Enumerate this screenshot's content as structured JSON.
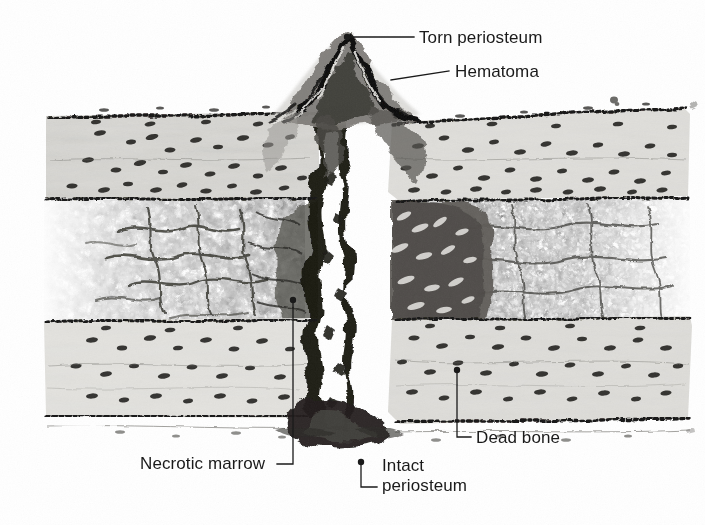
{
  "figure": {
    "background_color": "#ffffff",
    "ink_color": "#1a1a1a",
    "width": 705,
    "height": 525
  },
  "labels": [
    {
      "id": "torn-periosteum",
      "text": "Torn periosteum",
      "x": 419,
      "y": 28,
      "leader": {
        "type": "dot-line",
        "dot": [
          347,
          37
        ],
        "points": [
          [
            347,
            37
          ],
          [
            414,
            37
          ]
        ]
      }
    },
    {
      "id": "hematoma",
      "text": "Hematoma",
      "x": 455,
      "y": 62,
      "leader": {
        "type": "dot-line",
        "dot": [
          392,
          80
        ],
        "points": [
          [
            392,
            80
          ],
          [
            449,
            71
          ]
        ]
      }
    },
    {
      "id": "dead-bone",
      "text": "Dead bone",
      "x": 475,
      "y": 428,
      "leader": {
        "type": "elbow",
        "dot": [
          457,
          370
        ],
        "points": [
          [
            457,
            370
          ],
          [
            457,
            437
          ],
          [
            470,
            437
          ]
        ]
      }
    },
    {
      "id": "necrotic-marrow",
      "text": "Necrotic marrow",
      "x": 140,
      "y": 455,
      "leader": {
        "type": "elbow",
        "dot": [
          293,
          300
        ],
        "points": [
          [
            293,
            300
          ],
          [
            293,
            464
          ],
          [
            277,
            464
          ]
        ]
      }
    },
    {
      "id": "intact-periosteum",
      "text": "Intact\nperiosteum",
      "x": 381,
      "y": 458,
      "leader": {
        "type": "elbow",
        "dot": [
          361,
          462
        ],
        "points": [
          [
            361,
            462
          ],
          [
            361,
            487
          ],
          [
            377,
            487
          ]
        ]
      }
    }
  ],
  "anatomy": {
    "regions": [
      {
        "id": "upper-cortex-left",
        "name": "Upper cortical bone (left fragment)",
        "tone": "#d7d6d2"
      },
      {
        "id": "upper-cortex-right",
        "name": "Upper cortical bone (right fragment)",
        "tone": "#dddcd8"
      },
      {
        "id": "lower-cortex-left",
        "name": "Lower cortical bone (left fragment)",
        "tone": "#e2e1dd"
      },
      {
        "id": "lower-cortex-right",
        "name": "Lower cortical bone (right fragment)",
        "tone": "#dedcd8"
      },
      {
        "id": "marrow-cavity",
        "name": "Trabecular marrow cavity",
        "tone": "#efeeea"
      },
      {
        "id": "necrotic-zone",
        "name": "Necrotic marrow adjacent to fracture",
        "tone": "#6e6c68"
      },
      {
        "id": "fracture-gap",
        "name": "Fracture cleft",
        "tone": "#ffffff"
      },
      {
        "id": "hematoma-mound",
        "name": "Subperiosteal hematoma",
        "tone": "#5a5853"
      },
      {
        "id": "periosteum-upper",
        "name": "Periosteum (outer upper surface)",
        "tone": "#1d1c1a"
      },
      {
        "id": "periosteum-lower",
        "name": "Intact periosteum (outer lower surface)",
        "tone": "#1d1c1a"
      },
      {
        "id": "endosteum",
        "name": "Endosteal margin",
        "tone": "#1d1c1a"
      }
    ],
    "features": {
      "osteocyte_lacunae": "dark lenticular dots scattered through cortical bone",
      "trabeculae": "branching reticular network in the marrow cavity",
      "cement_lines": "faint horizontal lamellar lines crossing the cortex"
    }
  }
}
